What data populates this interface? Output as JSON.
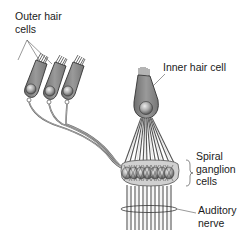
{
  "labels": {
    "outer_hair_cells": "Outer hair\ncells",
    "inner_hair_cell": "Inner hair cell",
    "spiral_ganglion_cells": "Spiral\nganglion\ncells",
    "auditory_nerve": "Auditory\nnerve"
  },
  "colors": {
    "cell_fill": "#8a8a8a",
    "cell_stroke": "#3a3a3a",
    "nucleus": "#b5b5b5",
    "fiber": "#6e6e6e",
    "fiber_light": "#c8c8c8",
    "label_text": "#1a1a1a",
    "leader_line": "#555555"
  }
}
